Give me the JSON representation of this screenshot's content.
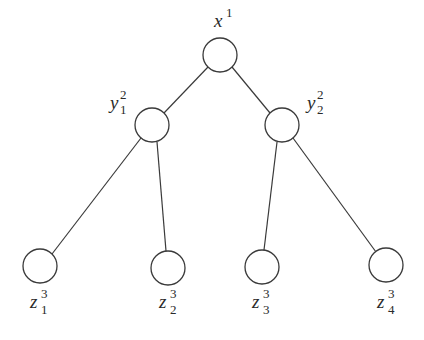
{
  "diagram": {
    "type": "tree",
    "stroke_color": "#3a3a3a",
    "background": "#ffffff",
    "nodes": [
      {
        "id": "root",
        "label": {
          "base": "x",
          "sup": "1",
          "sub": ""
        },
        "level": 1
      },
      {
        "id": "y1",
        "label": {
          "base": "y",
          "sup": "2",
          "sub": "1"
        },
        "level": 2,
        "parent": "root"
      },
      {
        "id": "y2",
        "label": {
          "base": "y",
          "sup": "2",
          "sub": "2"
        },
        "level": 2,
        "parent": "root"
      },
      {
        "id": "z1",
        "label": {
          "base": "z",
          "sup": "3",
          "sub": "1"
        },
        "level": 3,
        "parent": "y1"
      },
      {
        "id": "z2",
        "label": {
          "base": "z",
          "sup": "3",
          "sub": "2"
        },
        "level": 3,
        "parent": "y1"
      },
      {
        "id": "z3",
        "label": {
          "base": "z",
          "sup": "3",
          "sub": "3"
        },
        "level": 3,
        "parent": "y2"
      },
      {
        "id": "z4",
        "label": {
          "base": "z",
          "sup": "3",
          "sub": "4"
        },
        "level": 3,
        "parent": "y2"
      }
    ],
    "edges": [
      {
        "from": "root",
        "to": "y1"
      },
      {
        "from": "root",
        "to": "y2"
      },
      {
        "from": "y1",
        "to": "z1"
      },
      {
        "from": "y1",
        "to": "z2"
      },
      {
        "from": "y2",
        "to": "z3"
      },
      {
        "from": "y2",
        "to": "z4"
      }
    ]
  }
}
